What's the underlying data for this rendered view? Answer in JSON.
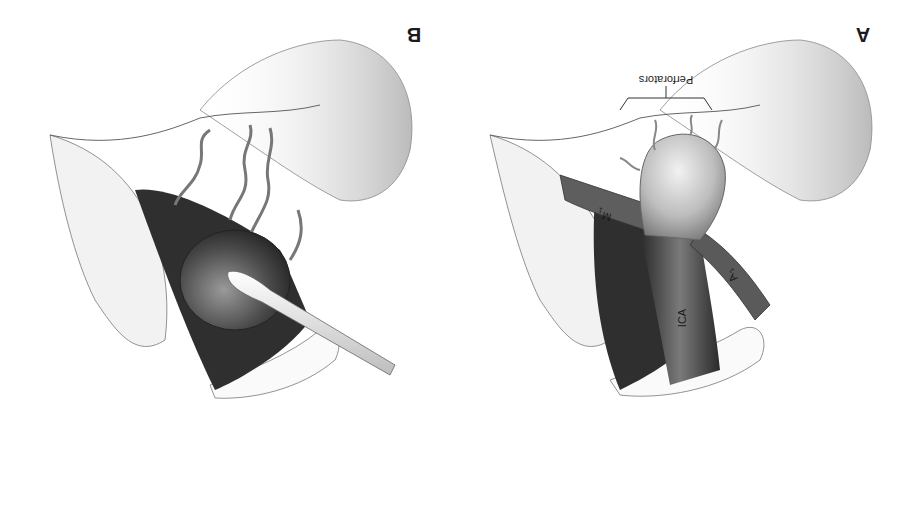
{
  "figure": {
    "orientation": "rotated 180 degrees",
    "panels": [
      {
        "id": "A",
        "letter": "A",
        "labels": {
          "perforators": "Perforators",
          "ica": "ICA",
          "m1": "M",
          "m1_sub": "1",
          "a1": "A",
          "a1_sub": "1"
        }
      },
      {
        "id": "B",
        "letter": "B"
      }
    ],
    "colors": {
      "background": "#ffffff",
      "tissue": "#e8e8e8",
      "vessel_dark": "#2a2a2a",
      "vessel_mid": "#6e6e6e",
      "vessel_light": "#cfcfcf",
      "outline": "#555555"
    }
  }
}
